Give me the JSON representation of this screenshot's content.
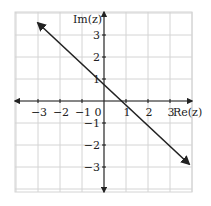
{
  "chart_data": {
    "type": "line",
    "title": "",
    "xlabel": "Re(z)",
    "ylabel": "Im(z)",
    "xlim": [
      -4,
      4
    ],
    "ylim": [
      -4,
      4
    ],
    "grid": true,
    "x_ticks": [
      -3,
      -2,
      -1,
      0,
      1,
      2,
      3
    ],
    "y_ticks": [
      -3,
      -2,
      -1,
      1,
      2,
      3
    ],
    "x_tick_labels": [
      "−3",
      "−2",
      "−1",
      "0",
      "1",
      "2",
      "3"
    ],
    "y_tick_labels": [
      "−3",
      "−2",
      "−1",
      "1",
      "2",
      "3"
    ],
    "series": [
      {
        "name": "Im(z) = −Re(z) + 1",
        "x": [
          -3,
          -2,
          -1,
          0,
          1,
          2,
          3,
          4
        ],
        "y": [
          4,
          3,
          2,
          1,
          0,
          -1,
          -2,
          -3
        ],
        "both_ends_arrows": true
      }
    ]
  },
  "labels": {
    "x_axis": "Re(z)",
    "y_axis": "Im(z)",
    "origin": "0"
  }
}
